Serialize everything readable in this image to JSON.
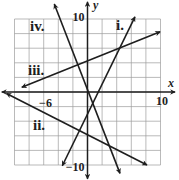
{
  "chart_data": {
    "type": "line",
    "title": "",
    "xlabel": "x",
    "ylabel": "y",
    "xlim": [
      -10,
      10
    ],
    "ylim": [
      -10,
      10
    ],
    "grid": true,
    "grid_step": 2,
    "axis_arrow_extent": {
      "x": [
        -11.75,
        12.0
      ],
      "y": [
        -11.9,
        12.35
      ]
    },
    "tick_labels": {
      "x": [
        {
          "value": -6,
          "label": "−6"
        },
        {
          "value": 10,
          "label": "10"
        }
      ],
      "y": [
        {
          "value": 10,
          "label": "10"
        },
        {
          "value": -10,
          "label": "−10"
        }
      ]
    },
    "legend": "none (lines labeled inline)",
    "series": [
      {
        "name": "i.",
        "equation_estimate": "y = 2x − 3",
        "slope": 2,
        "intercept": -3,
        "x": [
          -3.45,
          6.5
        ],
        "y": [
          -10.1,
          10.3
        ]
      },
      {
        "name": "ii.",
        "equation_estimate": "y = −0.5x − 6",
        "slope": -0.5,
        "intercept": -6,
        "x": [
          -11.1,
          8.15
        ],
        "y": [
          -0.2,
          -10.0
        ]
      },
      {
        "name": "iii.",
        "equation_estimate": "y = 0.4x + 4",
        "slope": 0.4,
        "intercept": 4,
        "x": [
          -9.0,
          9.95
        ],
        "y": [
          0.65,
          8.25
        ]
      },
      {
        "name": "iv.",
        "equation_estimate": "y = −2.5x",
        "slope": -2.5,
        "intercept": 0,
        "x": [
          -4.55,
          4.45
        ],
        "y": [
          12.05,
          -11.15
        ]
      }
    ]
  },
  "colors": {
    "line": "#1e1e1e",
    "grid": "#9c9c9c",
    "background": "#ffffff"
  }
}
